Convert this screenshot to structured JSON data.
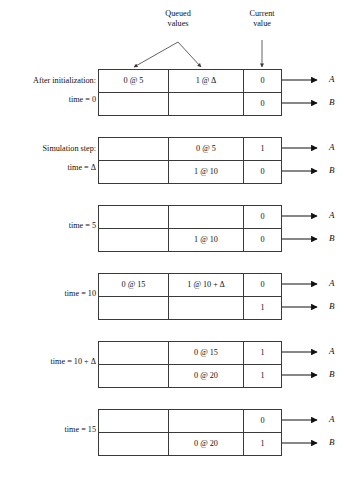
{
  "figure": {
    "signal_names": {
      "a": "A",
      "b": "B"
    },
    "callouts": [
      {
        "id": "queued-values",
        "text": "Queued\nvalues"
      },
      {
        "id": "current-value",
        "text": "Current\nvalue"
      }
    ],
    "columns": [
      "Queued value 1",
      "Queued value 2",
      "Current value"
    ],
    "blocks": [
      {
        "id": "after-initialization",
        "label_top": "After initialization:",
        "label_bottom": "time = 0",
        "label_mid": "",
        "rows": [
          {
            "signal": "A",
            "queued1": "0 @ 5",
            "queued2": "1 @ Δ",
            "current": "0"
          },
          {
            "signal": "B",
            "queued1": "",
            "queued2": "",
            "current": "0"
          }
        ]
      },
      {
        "id": "simulation-step-delta",
        "label_top": "Simulation step:",
        "label_bottom": "time = Δ",
        "label_mid": "",
        "rows": [
          {
            "signal": "A",
            "queued1": "",
            "queued2": "0 @ 5",
            "current": "1"
          },
          {
            "signal": "B",
            "queued1": "",
            "queued2": "1 @ 10",
            "current": "0"
          }
        ]
      },
      {
        "id": "time-5",
        "label_top": "",
        "label_bottom": "",
        "label_mid": "time = 5",
        "rows": [
          {
            "signal": "A",
            "queued1": "",
            "queued2": "",
            "current": "0"
          },
          {
            "signal": "B",
            "queued1": "",
            "queued2": "1 @ 10",
            "current": "0"
          }
        ]
      },
      {
        "id": "time-10",
        "label_top": "",
        "label_bottom": "",
        "label_mid": "time = 10",
        "rows": [
          {
            "signal": "A",
            "queued1": "0 @ 15",
            "queued2": "1 @ 10 + Δ",
            "current": "0"
          },
          {
            "signal": "B",
            "queued1": "",
            "queued2": "",
            "current": "1"
          }
        ]
      },
      {
        "id": "time-10-delta",
        "label_top": "",
        "label_bottom": "",
        "label_mid": "time = 10 + Δ",
        "rows": [
          {
            "signal": "A",
            "queued1": "",
            "queued2": "0 @ 15",
            "current": "1"
          },
          {
            "signal": "B",
            "queued1": "",
            "queued2": "0 @ 20",
            "current": "1"
          }
        ]
      },
      {
        "id": "time-15",
        "label_top": "",
        "label_bottom": "",
        "label_mid": "time = 15",
        "rows": [
          {
            "signal": "A",
            "queued1": "",
            "queued2": "",
            "current": "0"
          },
          {
            "signal": "B",
            "queued1": "",
            "queued2": "0 @ 20",
            "current": "1"
          }
        ]
      }
    ]
  }
}
